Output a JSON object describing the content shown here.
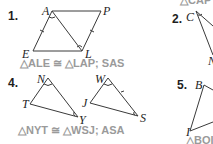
{
  "problems": [
    {
      "number": "1.",
      "vertices": [
        "A",
        "P",
        "E",
        "L"
      ],
      "answer": "△ALE ≅ △LAP; SAS"
    },
    {
      "number": "2.",
      "vertices": [
        "C",
        "N"
      ],
      "top_fragment": "△CAP"
    },
    {
      "number": "4.",
      "vertices": [
        "N",
        "T",
        "Y",
        "W",
        "J",
        "S"
      ],
      "answer": "△NYT ≅ △WSJ; ASA"
    },
    {
      "number": "5.",
      "vertices": [
        "B",
        "I"
      ],
      "answer": "△BOI"
    }
  ],
  "colors": {
    "text": "#1e1e1e",
    "answer": "#9a9a9a",
    "lines": "#3a3a3a"
  }
}
